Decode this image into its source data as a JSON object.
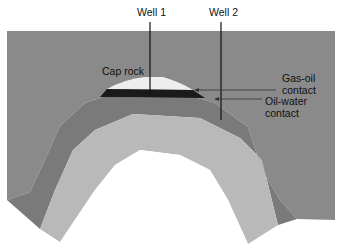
{
  "diagram": {
    "type": "anticline oil trap cross-section",
    "labels": {
      "well1": "Well 1",
      "well2": "Well 2",
      "cap_rock": "Cap rock",
      "gas_oil_1": "Gas-oil",
      "gas_oil_2": "contact",
      "oil_water_1": "Oil-water",
      "oil_water_2": "contact"
    },
    "colors": {
      "background_rock": "#8a8a8a",
      "reservoir_layer": "#7a7a7a",
      "inner_layer": "#b9b9b9",
      "gas": "#eeeeee",
      "oil": "#1a1a1a",
      "well_line": "#111111"
    }
  }
}
